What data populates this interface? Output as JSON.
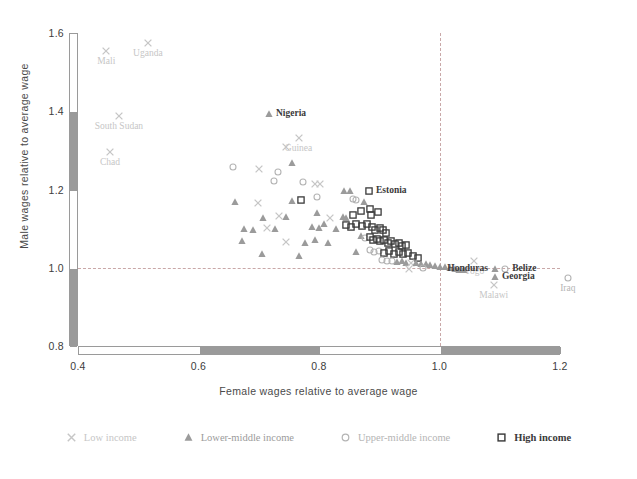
{
  "chart_data": {
    "type": "scatter",
    "title": "",
    "xlabel": "Female wages relative to average wage",
    "ylabel": "Male wages relative to average wage",
    "xlim": [
      0.4,
      1.2
    ],
    "ylim": [
      0.8,
      1.6
    ],
    "xticks": [
      "0.4",
      "0.6",
      "0.8",
      "1.0",
      "1.2"
    ],
    "xtick_values": [
      0.4,
      0.6,
      0.8,
      1.0,
      1.2
    ],
    "yticks": [
      "0.8",
      "1.0",
      "1.2",
      "1.4",
      "1.6"
    ],
    "ytick_values": [
      0.8,
      1.0,
      1.2,
      1.4,
      1.6
    ],
    "grid": false,
    "reference_lines": [
      {
        "axis": "x",
        "value": 1.0,
        "style": "dashed",
        "color": "#c9a8a8"
      },
      {
        "axis": "y",
        "value": 1.0,
        "style": "dashed",
        "color": "#c9a8a8"
      }
    ],
    "legend_position": "bottom",
    "series": [
      {
        "name": "Low income",
        "marker": "x",
        "color": "#c6c6c6"
      },
      {
        "name": "Lower-middle income",
        "marker": "triangle",
        "color": "#9b9b9b"
      },
      {
        "name": "Upper-middle income",
        "marker": "circle",
        "color": "#b4b4b4"
      },
      {
        "name": "High income",
        "marker": "square",
        "color": "#3a3a3a"
      }
    ],
    "annotations": [
      {
        "label": "Mali",
        "x": 0.447,
        "y": 1.553,
        "group": 0,
        "anchor": "center",
        "emph": false
      },
      {
        "label": "Uganda",
        "x": 0.516,
        "y": 1.574,
        "group": 0,
        "anchor": "center",
        "emph": false
      },
      {
        "label": "South Sudan",
        "x": 0.468,
        "y": 1.388,
        "group": 0,
        "anchor": "center",
        "emph": false
      },
      {
        "label": "Chad",
        "x": 0.453,
        "y": 1.297,
        "group": 0,
        "anchor": "center",
        "emph": false
      },
      {
        "label": "Nigeria",
        "x": 0.717,
        "y": 1.392,
        "group": 1,
        "anchor": "left",
        "emph": true
      },
      {
        "label": "Guinea",
        "x": 0.766,
        "y": 1.331,
        "group": 0,
        "anchor": "center",
        "emph": false
      },
      {
        "label": "Estonia",
        "x": 0.883,
        "y": 1.196,
        "group": 3,
        "anchor": "left",
        "emph": true
      },
      {
        "label": "Togo",
        "x": 1.058,
        "y": 1.016,
        "group": 0,
        "anchor": "center",
        "emph": false
      },
      {
        "label": "Honduras",
        "x": 1.092,
        "y": 0.997,
        "group": 1,
        "anchor": "right",
        "emph": true
      },
      {
        "label": "Belize",
        "x": 1.109,
        "y": 0.998,
        "group": 2,
        "anchor": "left",
        "emph": true
      },
      {
        "label": "Georgia",
        "x": 1.092,
        "y": 0.977,
        "group": 1,
        "anchor": "left",
        "emph": true
      },
      {
        "label": "Malawi",
        "x": 1.09,
        "y": 0.955,
        "group": 0,
        "anchor": "center",
        "emph": false
      },
      {
        "label": "Iraq",
        "x": 1.213,
        "y": 0.973,
        "group": 2,
        "anchor": "center",
        "emph": false
      }
    ],
    "points": [
      {
        "x": 0.447,
        "y": 1.553,
        "g": 0
      },
      {
        "x": 0.516,
        "y": 1.574,
        "g": 0
      },
      {
        "x": 0.468,
        "y": 1.388,
        "g": 0
      },
      {
        "x": 0.453,
        "y": 1.297,
        "g": 0
      },
      {
        "x": 0.717,
        "y": 1.392,
        "g": 1
      },
      {
        "x": 0.766,
        "y": 1.331,
        "g": 0
      },
      {
        "x": 0.745,
        "y": 1.308,
        "g": 0
      },
      {
        "x": 0.657,
        "y": 1.258,
        "g": 2
      },
      {
        "x": 0.7,
        "y": 1.252,
        "g": 0
      },
      {
        "x": 0.732,
        "y": 1.245,
        "g": 2
      },
      {
        "x": 0.756,
        "y": 1.268,
        "g": 1
      },
      {
        "x": 0.726,
        "y": 1.222,
        "g": 2
      },
      {
        "x": 0.773,
        "y": 1.218,
        "g": 2
      },
      {
        "x": 0.793,
        "y": 1.215,
        "g": 0
      },
      {
        "x": 0.801,
        "y": 1.214,
        "g": 0
      },
      {
        "x": 0.661,
        "y": 1.168,
        "g": 1
      },
      {
        "x": 0.698,
        "y": 1.166,
        "g": 0
      },
      {
        "x": 0.756,
        "y": 1.17,
        "g": 1
      },
      {
        "x": 0.77,
        "y": 1.173,
        "g": 3
      },
      {
        "x": 0.797,
        "y": 1.182,
        "g": 2
      },
      {
        "x": 0.841,
        "y": 1.196,
        "g": 1
      },
      {
        "x": 0.851,
        "y": 1.196,
        "g": 1
      },
      {
        "x": 0.883,
        "y": 1.196,
        "g": 3
      },
      {
        "x": 0.856,
        "y": 1.176,
        "g": 2
      },
      {
        "x": 0.862,
        "y": 1.174,
        "g": 2
      },
      {
        "x": 0.875,
        "y": 1.168,
        "g": 1
      },
      {
        "x": 0.707,
        "y": 1.128,
        "g": 1
      },
      {
        "x": 0.733,
        "y": 1.131,
        "g": 0
      },
      {
        "x": 0.746,
        "y": 1.129,
        "g": 1
      },
      {
        "x": 0.796,
        "y": 1.141,
        "g": 1
      },
      {
        "x": 0.819,
        "y": 1.128,
        "g": 0
      },
      {
        "x": 0.84,
        "y": 1.13,
        "g": 1
      },
      {
        "x": 0.845,
        "y": 1.126,
        "g": 1
      },
      {
        "x": 0.856,
        "y": 1.135,
        "g": 3
      },
      {
        "x": 0.869,
        "y": 1.146,
        "g": 3
      },
      {
        "x": 0.884,
        "y": 1.149,
        "g": 3
      },
      {
        "x": 0.886,
        "y": 1.135,
        "g": 3
      },
      {
        "x": 0.898,
        "y": 1.143,
        "g": 3
      },
      {
        "x": 0.676,
        "y": 1.1,
        "g": 1
      },
      {
        "x": 0.691,
        "y": 1.097,
        "g": 1
      },
      {
        "x": 0.713,
        "y": 1.102,
        "g": 0
      },
      {
        "x": 0.727,
        "y": 1.1,
        "g": 1
      },
      {
        "x": 0.789,
        "y": 1.105,
        "g": 1
      },
      {
        "x": 0.8,
        "y": 1.102,
        "g": 1
      },
      {
        "x": 0.808,
        "y": 1.111,
        "g": 1
      },
      {
        "x": 0.828,
        "y": 1.098,
        "g": 1
      },
      {
        "x": 0.845,
        "y": 1.108,
        "g": 3
      },
      {
        "x": 0.853,
        "y": 1.104,
        "g": 3
      },
      {
        "x": 0.862,
        "y": 1.112,
        "g": 3
      },
      {
        "x": 0.872,
        "y": 1.106,
        "g": 3
      },
      {
        "x": 0.879,
        "y": 1.112,
        "g": 3
      },
      {
        "x": 0.888,
        "y": 1.103,
        "g": 3
      },
      {
        "x": 0.893,
        "y": 1.097,
        "g": 3
      },
      {
        "x": 0.901,
        "y": 1.102,
        "g": 3
      },
      {
        "x": 0.906,
        "y": 1.096,
        "g": 3
      },
      {
        "x": 0.911,
        "y": 1.089,
        "g": 3
      },
      {
        "x": 0.672,
        "y": 1.068,
        "g": 1
      },
      {
        "x": 0.746,
        "y": 1.066,
        "g": 0
      },
      {
        "x": 0.776,
        "y": 1.064,
        "g": 1
      },
      {
        "x": 0.793,
        "y": 1.072,
        "g": 1
      },
      {
        "x": 0.815,
        "y": 1.062,
        "g": 1
      },
      {
        "x": 0.87,
        "y": 1.081,
        "g": 1
      },
      {
        "x": 0.876,
        "y": 1.075,
        "g": 2
      },
      {
        "x": 0.884,
        "y": 1.078,
        "g": 3
      },
      {
        "x": 0.89,
        "y": 1.071,
        "g": 3
      },
      {
        "x": 0.896,
        "y": 1.074,
        "g": 3
      },
      {
        "x": 0.902,
        "y": 1.068,
        "g": 3
      },
      {
        "x": 0.908,
        "y": 1.072,
        "g": 3
      },
      {
        "x": 0.914,
        "y": 1.064,
        "g": 3
      },
      {
        "x": 0.92,
        "y": 1.068,
        "g": 3
      },
      {
        "x": 0.926,
        "y": 1.06,
        "g": 3
      },
      {
        "x": 0.932,
        "y": 1.062,
        "g": 3
      },
      {
        "x": 0.938,
        "y": 1.056,
        "g": 3
      },
      {
        "x": 0.944,
        "y": 1.058,
        "g": 3
      },
      {
        "x": 0.706,
        "y": 1.035,
        "g": 1
      },
      {
        "x": 0.767,
        "y": 1.03,
        "g": 1
      },
      {
        "x": 0.862,
        "y": 1.041,
        "g": 1
      },
      {
        "x": 0.884,
        "y": 1.046,
        "g": 2
      },
      {
        "x": 0.892,
        "y": 1.04,
        "g": 2
      },
      {
        "x": 0.9,
        "y": 1.044,
        "g": 2
      },
      {
        "x": 0.908,
        "y": 1.038,
        "g": 3
      },
      {
        "x": 0.916,
        "y": 1.042,
        "g": 3
      },
      {
        "x": 0.924,
        "y": 1.036,
        "g": 3
      },
      {
        "x": 0.932,
        "y": 1.04,
        "g": 3
      },
      {
        "x": 0.94,
        "y": 1.034,
        "g": 3
      },
      {
        "x": 0.948,
        "y": 1.038,
        "g": 3
      },
      {
        "x": 0.956,
        "y": 1.03,
        "g": 3
      },
      {
        "x": 0.964,
        "y": 1.026,
        "g": 3
      },
      {
        "x": 0.905,
        "y": 1.02,
        "g": 2
      },
      {
        "x": 0.913,
        "y": 1.018,
        "g": 2
      },
      {
        "x": 0.921,
        "y": 1.016,
        "g": 2
      },
      {
        "x": 0.929,
        "y": 1.014,
        "g": 1
      },
      {
        "x": 0.937,
        "y": 1.017,
        "g": 1
      },
      {
        "x": 0.945,
        "y": 1.013,
        "g": 1
      },
      {
        "x": 0.953,
        "y": 1.011,
        "g": 0
      },
      {
        "x": 0.961,
        "y": 1.012,
        "g": 1
      },
      {
        "x": 0.969,
        "y": 1.009,
        "g": 1
      },
      {
        "x": 0.977,
        "y": 1.01,
        "g": 1
      },
      {
        "x": 0.985,
        "y": 1.007,
        "g": 1
      },
      {
        "x": 0.993,
        "y": 1.005,
        "g": 1
      },
      {
        "x": 1.001,
        "y": 1.003,
        "g": 1
      },
      {
        "x": 1.009,
        "y": 1.001,
        "g": 1
      },
      {
        "x": 1.017,
        "y": 0.999,
        "g": 1
      },
      {
        "x": 1.025,
        "y": 0.997,
        "g": 1
      },
      {
        "x": 1.033,
        "y": 0.995,
        "g": 1
      },
      {
        "x": 1.041,
        "y": 0.993,
        "g": 1
      },
      {
        "x": 0.95,
        "y": 0.998,
        "g": 0
      },
      {
        "x": 0.972,
        "y": 1.0,
        "g": 2
      },
      {
        "x": 1.058,
        "y": 1.016,
        "g": 0
      },
      {
        "x": 1.092,
        "y": 0.997,
        "g": 1
      },
      {
        "x": 1.109,
        "y": 0.998,
        "g": 2
      },
      {
        "x": 1.092,
        "y": 0.977,
        "g": 1
      },
      {
        "x": 1.09,
        "y": 0.955,
        "g": 0
      },
      {
        "x": 1.213,
        "y": 0.973,
        "g": 2
      }
    ]
  },
  "legend": {
    "items": [
      {
        "label": "Low income",
        "icon": "cross-marker-icon"
      },
      {
        "label": "Lower-middle income",
        "icon": "triangle-marker-icon"
      },
      {
        "label": "Upper-middle income",
        "icon": "circle-marker-icon"
      },
      {
        "label": "High income",
        "icon": "square-marker-icon"
      }
    ]
  },
  "colors": {
    "low_income": "#c6c6c6",
    "lower_middle_income": "#9b9b9b",
    "upper_middle_income": "#b4b4b4",
    "high_income": "#3a3a3a",
    "reference_line": "#c9a8a8",
    "axis_bar": "#9a9a9a",
    "text": "#3c3c3c"
  }
}
